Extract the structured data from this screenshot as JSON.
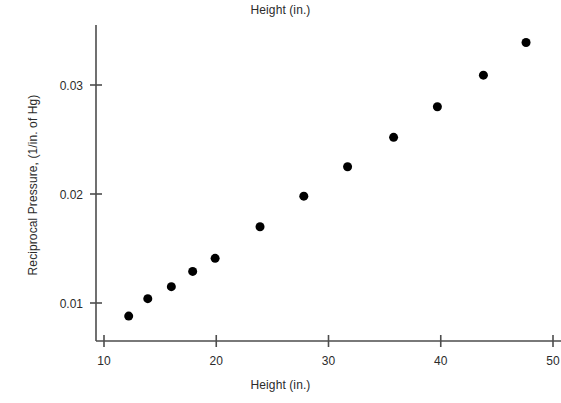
{
  "chart_data": {
    "type": "scatter",
    "title": "Height (in.)",
    "xlabel": "Height (in.)",
    "ylabel": "Reciprocal Pressure, (1/in. of Hg)",
    "xlim": [
      9.3,
      50.6
    ],
    "ylim": [
      0.0075,
      0.0355
    ],
    "grid": false,
    "legend": null,
    "legend_position": "none",
    "xticks": [
      10,
      20,
      30,
      40,
      50
    ],
    "xtick_labels": [
      "10",
      "20",
      "30",
      "40",
      "50"
    ],
    "yticks": [
      0.01,
      0.02,
      0.03
    ],
    "ytick_labels": [
      "0.01",
      "0.02",
      "0.03"
    ],
    "marker": "filled-circle",
    "marker_color": "#000000",
    "axis_color": "#4d4d4d",
    "background_color": "#ffffff",
    "x": [
      12.2,
      13.9,
      16.0,
      17.9,
      19.9,
      23.9,
      27.8,
      31.7,
      35.8,
      39.7,
      43.8,
      47.6
    ],
    "y": [
      0.0088,
      0.0104,
      0.0115,
      0.0129,
      0.0141,
      0.017,
      0.0198,
      0.0225,
      0.0252,
      0.028,
      0.0309,
      0.0339
    ],
    "points": [
      {
        "x": 12.2,
        "y": 0.0088
      },
      {
        "x": 13.9,
        "y": 0.0104
      },
      {
        "x": 16.0,
        "y": 0.0115
      },
      {
        "x": 17.9,
        "y": 0.0129
      },
      {
        "x": 19.9,
        "y": 0.0141
      },
      {
        "x": 23.9,
        "y": 0.017
      },
      {
        "x": 27.8,
        "y": 0.0198
      },
      {
        "x": 31.7,
        "y": 0.0225
      },
      {
        "x": 35.8,
        "y": 0.0252
      },
      {
        "x": 39.7,
        "y": 0.028
      },
      {
        "x": 43.8,
        "y": 0.0309
      },
      {
        "x": 47.6,
        "y": 0.0339
      }
    ]
  },
  "axes_geometry": {
    "x_axis_y_px": 341,
    "y_axis_x_px": 96,
    "y_axis_top_px": 25,
    "x_axis_left_px": 96,
    "x_axis_right_px": 561,
    "x_px_at_10": 104,
    "x_px_at_50": 553,
    "y_px_at_001": 303,
    "y_px_at_003": 85,
    "marker_radius_px": 4.5,
    "tick_len_px": 6
  }
}
